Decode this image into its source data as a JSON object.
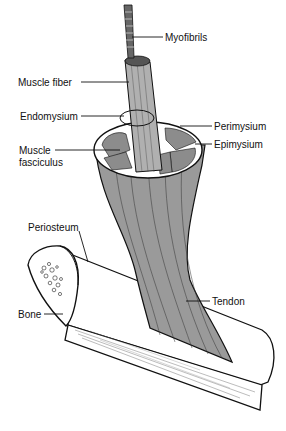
{
  "diagram": {
    "colors": {
      "muscle": "#9a9a9a",
      "muscle_dark": "#7d7d7d",
      "outline": "#111111",
      "bone": "#ffffff",
      "background": "#ffffff"
    },
    "labels": {
      "myofibrils": "Myofibrils",
      "muscle_fiber": "Muscle fiber",
      "endomysium": "Endomysium",
      "perimysium": "Perimysium",
      "epimysium": "Epimysium",
      "muscle_fasciculus_line1": "Muscle",
      "muscle_fasciculus_line2": "fasciculus",
      "periosteum": "Periosteum",
      "bone": "Bone",
      "tendon": "Tendon"
    }
  }
}
